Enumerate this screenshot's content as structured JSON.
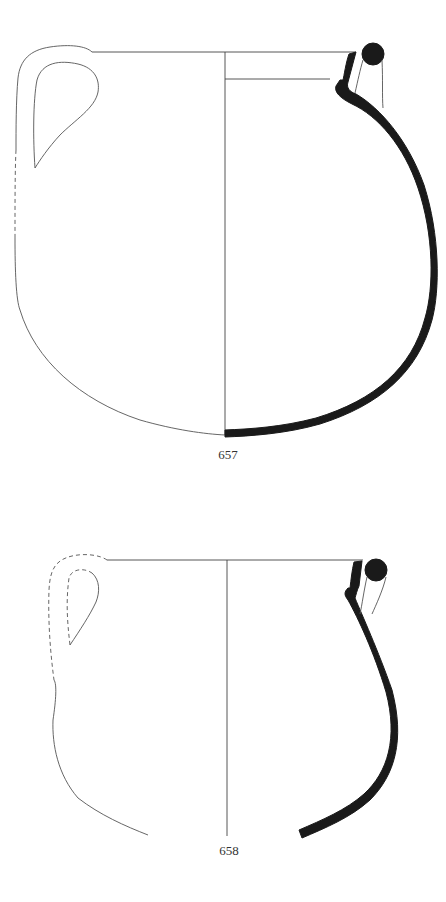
{
  "figure": {
    "type": "pottery profile drawing",
    "vessels": [
      {
        "id": "vessel-657",
        "catalogue_number": "657",
        "handle_outline": "partially dashed (reconstructed)"
      },
      {
        "id": "vessel-658",
        "catalogue_number": "658",
        "handle_outline": "dashed (reconstructed)"
      }
    ]
  },
  "colors": {
    "section_fill": "#1a1a1a",
    "outline": "#555555",
    "background": "#ffffff"
  }
}
